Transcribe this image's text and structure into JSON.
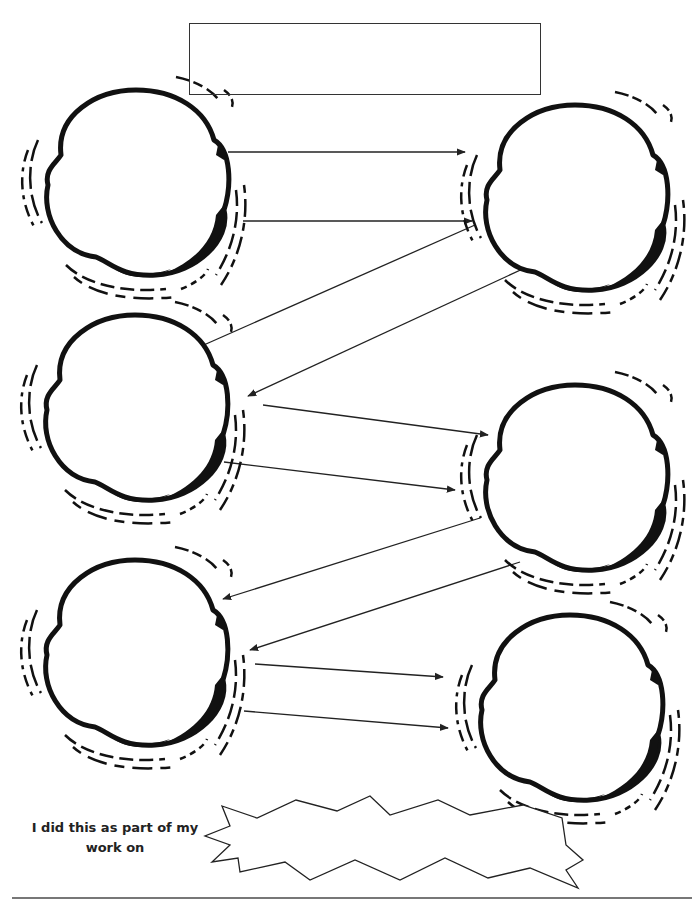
{
  "worksheet": {
    "title_box": {
      "value": ""
    },
    "caption": {
      "line1": "I did this as part of my",
      "line2": "work on"
    },
    "banner_input": {
      "value": ""
    },
    "colors": {
      "ink": "#111111",
      "line": "#333333",
      "rule": "#777777"
    }
  },
  "nodes": [
    {
      "id": "node-1",
      "cx": 136,
      "cy": 185,
      "value": ""
    },
    {
      "id": "node-2",
      "cx": 575,
      "cy": 200,
      "value": ""
    },
    {
      "id": "node-3",
      "cx": 135,
      "cy": 410,
      "value": ""
    },
    {
      "id": "node-4",
      "cx": 575,
      "cy": 480,
      "value": ""
    },
    {
      "id": "node-5",
      "cx": 135,
      "cy": 655,
      "value": ""
    },
    {
      "id": "node-6",
      "cx": 570,
      "cy": 710,
      "value": ""
    }
  ],
  "arrows": [
    {
      "from": "node-1",
      "to": "node-2",
      "x1": 228,
      "y1": 152,
      "x2": 465,
      "y2": 152
    },
    {
      "from": "node-1",
      "to": "node-2",
      "x1": 243,
      "y1": 221,
      "x2": 472,
      "y2": 221
    },
    {
      "from": "node-2",
      "to": "node-3",
      "x1": 475,
      "y1": 225,
      "x2": 197,
      "y2": 348
    },
    {
      "from": "node-2",
      "to": "node-3",
      "x1": 527,
      "y1": 267,
      "x2": 248,
      "y2": 396
    },
    {
      "from": "node-3",
      "to": "node-4",
      "x1": 263,
      "y1": 405,
      "x2": 488,
      "y2": 435
    },
    {
      "from": "node-3",
      "to": "node-4",
      "x1": 224,
      "y1": 462,
      "x2": 455,
      "y2": 490
    },
    {
      "from": "node-4",
      "to": "node-5",
      "x1": 480,
      "y1": 518,
      "x2": 223,
      "y2": 599
    },
    {
      "from": "node-4",
      "to": "node-5",
      "x1": 520,
      "y1": 562,
      "x2": 250,
      "y2": 650
    },
    {
      "from": "node-5",
      "to": "node-6",
      "x1": 255,
      "y1": 664,
      "x2": 443,
      "y2": 677
    },
    {
      "from": "node-5",
      "to": "node-6",
      "x1": 244,
      "y1": 711,
      "x2": 448,
      "y2": 728
    }
  ]
}
